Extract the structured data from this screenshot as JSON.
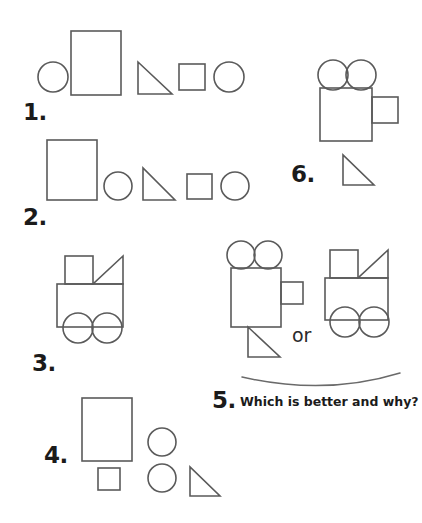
{
  "page": {
    "width": 422,
    "height": 523,
    "background": "#ffffff",
    "stroke_color": "#5a5a5a",
    "text_color": "#1b1b1b"
  },
  "labels": {
    "item1": "1.",
    "item2": "2.",
    "item3": "3.",
    "item4": "4.",
    "item5": "5.",
    "item6": "6.",
    "or": "or",
    "question": "Which is better and why?"
  },
  "items": [
    {
      "number": "1.",
      "kind": "shape-set",
      "shapes": [
        {
          "type": "circle",
          "cx": 53,
          "cy": 77,
          "r": 15
        },
        {
          "type": "rectangle",
          "x": 71,
          "y": 31,
          "w": 50,
          "h": 64
        },
        {
          "type": "triangle",
          "x": 138,
          "y": 62,
          "w": 34,
          "h": 32,
          "orientation": "right-down"
        },
        {
          "type": "square",
          "x": 179,
          "y": 64,
          "w": 26,
          "h": 26
        },
        {
          "type": "circle",
          "cx": 229,
          "cy": 77,
          "r": 15
        }
      ]
    },
    {
      "number": "2.",
      "kind": "shape-set",
      "shapes": [
        {
          "type": "rectangle",
          "x": 47,
          "y": 140,
          "w": 50,
          "h": 60
        },
        {
          "type": "circle",
          "cx": 118,
          "cy": 186,
          "r": 14
        },
        {
          "type": "triangle",
          "x": 143,
          "y": 168,
          "w": 32,
          "h": 32,
          "orientation": "right-down"
        },
        {
          "type": "square",
          "x": 187,
          "y": 174,
          "w": 25,
          "h": 25
        },
        {
          "type": "circle",
          "cx": 235,
          "cy": 186,
          "r": 14
        }
      ]
    },
    {
      "number": "3.",
      "kind": "assembled-truck",
      "shapes": [
        {
          "type": "square",
          "x": 65,
          "y": 256,
          "w": 28,
          "h": 28
        },
        {
          "type": "triangle",
          "x": 93,
          "y": 256,
          "w": 30,
          "h": 28,
          "orientation": "right-up"
        },
        {
          "type": "rectangle",
          "x": 57,
          "y": 284,
          "w": 66,
          "h": 43
        },
        {
          "type": "circle",
          "cx": 78,
          "cy": 328,
          "r": 15
        },
        {
          "type": "circle",
          "cx": 107,
          "cy": 328,
          "r": 15
        }
      ]
    },
    {
      "number": "4.",
      "kind": "shape-set",
      "shapes": [
        {
          "type": "rectangle",
          "x": 82,
          "y": 398,
          "w": 50,
          "h": 63
        },
        {
          "type": "square",
          "x": 98,
          "y": 468,
          "w": 22,
          "h": 22
        },
        {
          "type": "circle",
          "cx": 162,
          "cy": 442,
          "r": 14
        },
        {
          "type": "circle",
          "cx": 162,
          "cy": 478,
          "r": 14
        },
        {
          "type": "triangle",
          "x": 190,
          "y": 467,
          "w": 30,
          "h": 29,
          "orientation": "right-down"
        }
      ]
    },
    {
      "number": "5.",
      "kind": "comparison",
      "question": "Which is better and why?",
      "connector": "or",
      "option_a": {
        "name": "camera-figure",
        "shapes": [
          {
            "type": "circle",
            "cx": 241,
            "cy": 255,
            "r": 14
          },
          {
            "type": "circle",
            "cx": 268,
            "cy": 255,
            "r": 14
          },
          {
            "type": "rectangle",
            "x": 231,
            "y": 268,
            "w": 50,
            "h": 59
          },
          {
            "type": "rectangle",
            "x": 281,
            "y": 282,
            "w": 22,
            "h": 22
          },
          {
            "type": "triangle",
            "x": 248,
            "y": 327,
            "w": 32,
            "h": 30,
            "orientation": "right-down"
          }
        ]
      },
      "option_b": {
        "name": "truck-figure",
        "shapes": [
          {
            "type": "square",
            "x": 330,
            "y": 250,
            "w": 28,
            "h": 28
          },
          {
            "type": "triangle",
            "x": 358,
            "y": 250,
            "w": 30,
            "h": 28,
            "orientation": "right-up"
          },
          {
            "type": "rectangle",
            "x": 325,
            "y": 278,
            "w": 63,
            "h": 42
          },
          {
            "type": "circle",
            "cx": 345,
            "cy": 322,
            "r": 15
          },
          {
            "type": "circle",
            "cx": 374,
            "cy": 322,
            "r": 15
          }
        ]
      }
    },
    {
      "number": "6.",
      "kind": "assembled-camera",
      "shapes": [
        {
          "type": "circle",
          "cx": 333,
          "cy": 75,
          "r": 15
        },
        {
          "type": "circle",
          "cx": 361,
          "cy": 75,
          "r": 15
        },
        {
          "type": "rectangle",
          "x": 320,
          "y": 88,
          "w": 52,
          "h": 53
        },
        {
          "type": "rectangle",
          "x": 372,
          "y": 97,
          "w": 26,
          "h": 26
        },
        {
          "type": "triangle",
          "x": 343,
          "y": 155,
          "w": 31,
          "h": 30,
          "orientation": "right-down"
        }
      ]
    }
  ]
}
